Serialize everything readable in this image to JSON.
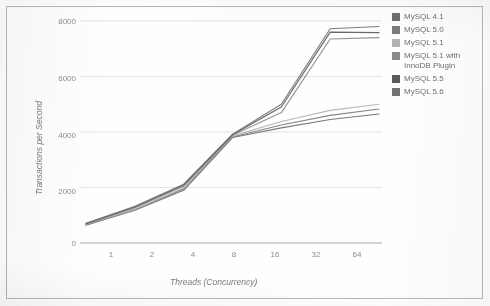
{
  "chart_data": {
    "type": "line",
    "title": "",
    "xlabel": "Threads (Concurrency)",
    "ylabel": "Transactions per Second",
    "categories": [
      "1",
      "2",
      "4",
      "8",
      "16",
      "32",
      "64"
    ],
    "ylim": [
      0,
      8000
    ],
    "yticks": [
      0,
      2000,
      4000,
      6000,
      8000
    ],
    "grid": true,
    "legend_position": "right",
    "series": [
      {
        "name": "MySQL 4.1",
        "color": "#6e6e6e",
        "values": [
          640,
          1180,
          1900,
          3800,
          4150,
          4450,
          4650
        ]
      },
      {
        "name": "MySQL 5.0",
        "color": "#7c7c7c",
        "values": [
          660,
          1200,
          1950,
          3820,
          4250,
          4600,
          4830
        ]
      },
      {
        "name": "MySQL 5.1",
        "color": "#b2b2b2",
        "values": [
          670,
          1220,
          1980,
          3850,
          4380,
          4780,
          5000
        ]
      },
      {
        "name": "MySQL 5.1 with InnoDB Plugin",
        "color": "#8a8a8a",
        "values": [
          690,
          1270,
          2050,
          3880,
          4700,
          7350,
          7400
        ]
      },
      {
        "name": "MySQL 5.5",
        "color": "#5a5a5a",
        "values": [
          700,
          1300,
          2090,
          3900,
          4900,
          7600,
          7580
        ]
      },
      {
        "name": "MySQL 5.6",
        "color": "#747474",
        "values": [
          710,
          1320,
          2120,
          3920,
          5000,
          7720,
          7800
        ]
      }
    ]
  },
  "axes": {
    "y_tick_labels": [
      "8000",
      "6000",
      "4000",
      "2000",
      "0"
    ],
    "x_tick_labels": [
      "1",
      "2",
      "4",
      "8",
      "16",
      "32",
      "64"
    ],
    "x_axis_title": "Threads (Concurrency)",
    "y_axis_title": "Transactions per Second"
  },
  "legend": {
    "items": [
      {
        "label": "MySQL 4.1",
        "color": "#6e6e6e"
      },
      {
        "label": "MySQL 5.0",
        "color": "#7c7c7c"
      },
      {
        "label": "MySQL 5.1",
        "color": "#b2b2b2"
      },
      {
        "label": "MySQL 5.1 with InnoDB Plugin",
        "color": "#8a8a8a"
      },
      {
        "label": "MySQL 5.5",
        "color": "#5a5a5a"
      },
      {
        "label": "MySQL 5.6",
        "color": "#747474"
      }
    ]
  },
  "style": {
    "background": "#fefefe",
    "border_color": "#b9b9b9",
    "gridline_color": "#dcdcdc",
    "axis_text_color": "#8d8d8d"
  }
}
